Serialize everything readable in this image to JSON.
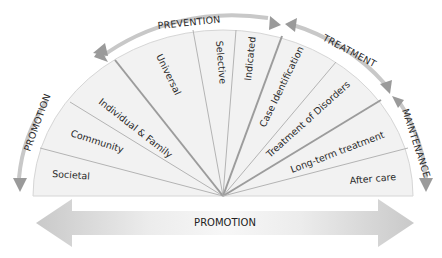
{
  "segments": [
    {
      "label": "Societal"
    },
    {
      "label": "Community"
    },
    {
      "label": "Individual & Family"
    },
    {
      "label": "Universal"
    },
    {
      "label": "Selective"
    },
    {
      "label": "Indicated"
    },
    {
      "label": "Case Identification"
    },
    {
      "label": "Treatment of Disorders"
    },
    {
      "label": "Long-term treatment"
    },
    {
      "label": "After care"
    }
  ],
  "arcs": {
    "promotion_left": "PROMOTION",
    "prevention": "PREVENTION",
    "treatment": "TREATMENT",
    "maintenance": "MAINTENANCE"
  },
  "bottom_arrow": {
    "label": "PROMOTION"
  },
  "colors": {
    "fan_fill": "#f1f1f1",
    "spoke": "#a9a9a9",
    "arc": "#c4c4c4",
    "arrowhead": "#9a9a9a",
    "bottom_arrow": "#cfcfcf"
  }
}
